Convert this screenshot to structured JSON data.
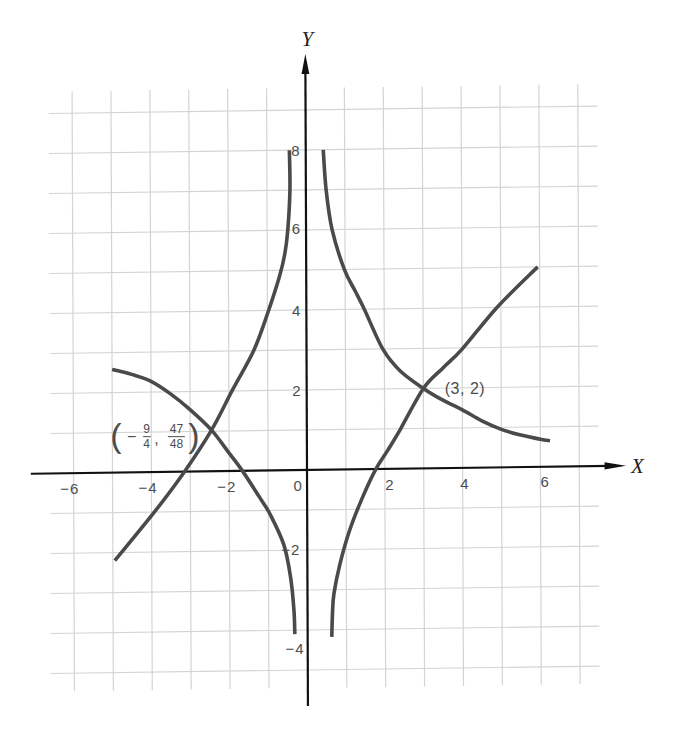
{
  "colors": {
    "background": "#ffffff",
    "curve": "#4a4a4a",
    "axis": "#111111",
    "grid": "#d4d4d4",
    "label": "#4d4d4d",
    "axis_title": "#222222"
  },
  "chart_data": {
    "type": "line",
    "title": "",
    "xlabel": "X",
    "ylabel": "Y",
    "xlim": [
      -7.1,
      8.2
    ],
    "ylim": [
      -5.9,
      10.4
    ],
    "grid": {
      "on": true,
      "x_lines": [
        -6,
        7
      ],
      "y_lines": [
        -5,
        9
      ],
      "x_extent": [
        -6.6,
        7.5
      ],
      "y_extent": [
        -5.45,
        9.55
      ]
    },
    "x_ticks": [
      {
        "value": -6,
        "label": "−6",
        "pos": [
          -6.1,
          -0.38
        ]
      },
      {
        "value": -4,
        "label": "−4",
        "pos": [
          -4.09,
          -0.38
        ]
      },
      {
        "value": -2,
        "label": "−2",
        "pos": [
          -2.06,
          -0.38
        ]
      },
      {
        "value": 0,
        "label": "0",
        "pos": [
          -0.23,
          -0.38
        ]
      },
      {
        "value": 2,
        "label": "2",
        "pos": [
          2.13,
          -0.38
        ]
      },
      {
        "value": 4,
        "label": "4",
        "pos": [
          4.06,
          -0.38
        ]
      },
      {
        "value": 6,
        "label": "6",
        "pos": [
          6.12,
          -0.38
        ]
      }
    ],
    "y_ticks": [
      {
        "value": 8,
        "label": "8",
        "pos": [
          -0.13,
          8.0
        ]
      },
      {
        "value": 6,
        "label": "6",
        "pos": [
          -0.13,
          6.05
        ]
      },
      {
        "value": 4,
        "label": "4",
        "pos": [
          -0.13,
          4.0
        ]
      },
      {
        "value": 2,
        "label": "2",
        "pos": [
          -0.13,
          2.0
        ]
      },
      {
        "value": -2,
        "label": "−2",
        "pos": [
          -0.18,
          -1.98
        ]
      },
      {
        "value": -4,
        "label": "−4",
        "pos": [
          -0.08,
          -4.47
        ]
      }
    ],
    "series": [
      {
        "id": "curve-a",
        "branches": [
          [
            [
              0.45,
              8.0
            ],
            [
              0.52,
              7.0
            ],
            [
              0.67,
              6.0
            ],
            [
              0.98,
              5.0
            ],
            [
              1.25,
              4.47
            ],
            [
              1.49,
              4.0
            ],
            [
              1.96,
              3.0
            ],
            [
              2.4,
              2.45
            ],
            [
              3.0,
              2.0
            ],
            [
              3.5,
              1.7
            ],
            [
              4.0,
              1.45
            ],
            [
              4.5,
              1.17
            ],
            [
              5.0,
              0.95
            ],
            [
              5.5,
              0.8
            ],
            [
              6.0,
              0.69
            ],
            [
              6.25,
              0.65
            ]
          ],
          [
            [
              -5.0,
              2.58
            ],
            [
              -4.5,
              2.45
            ],
            [
              -4.0,
              2.27
            ],
            [
              -3.5,
              1.95
            ],
            [
              -3.0,
              1.55
            ],
            [
              -2.45,
              1.03
            ],
            [
              -2.0,
              0.45
            ],
            [
              -1.66,
              0.0
            ],
            [
              -1.2,
              -0.7
            ],
            [
              -0.95,
              -1.1
            ],
            [
              -0.6,
              -1.87
            ],
            [
              -0.43,
              -2.7
            ],
            [
              -0.35,
              -3.5
            ],
            [
              -0.33,
              -4.1
            ]
          ]
        ]
      },
      {
        "id": "curve-b",
        "branches": [
          [
            [
              -0.42,
              8.0
            ],
            [
              -0.41,
              7.0
            ],
            [
              -0.47,
              6.0
            ],
            [
              -0.55,
              5.4
            ],
            [
              -0.69,
              4.84
            ],
            [
              -1.0,
              3.92
            ],
            [
              -1.36,
              3.0
            ],
            [
              -1.91,
              2.02
            ],
            [
              -2.45,
              1.03
            ],
            [
              -3.15,
              0.0
            ],
            [
              -3.92,
              -0.99
            ],
            [
              -4.95,
              -2.2
            ]
          ],
          [
            [
              0.62,
              -4.18
            ],
            [
              0.64,
              -3.6
            ],
            [
              0.68,
              -3.1
            ],
            [
              0.84,
              -2.35
            ],
            [
              1.09,
              -1.52
            ],
            [
              1.43,
              -0.69
            ],
            [
              1.77,
              0.0
            ],
            [
              2.08,
              0.47
            ],
            [
              2.4,
              0.98
            ],
            [
              3.0,
              2.0
            ],
            [
              3.5,
              2.5
            ],
            [
              4.0,
              2.97
            ],
            [
              4.9,
              4.0
            ],
            [
              5.95,
              5.0
            ]
          ]
        ]
      }
    ],
    "annotations": [
      {
        "text": "(3, 2)",
        "x": 3,
        "y": 2,
        "label_pos": [
          3.55,
          2.0
        ]
      },
      {
        "text": "(−9/4, 47/48)",
        "x": -2.25,
        "y": 0.979,
        "label_pos": [
          -5.0,
          0.92
        ],
        "parts": {
          "open": "(",
          "sign": "−",
          "num1": "9",
          "den1": "4",
          "sep": ",",
          "num2": "47",
          "den2": "48",
          "close": ")"
        }
      }
    ]
  }
}
